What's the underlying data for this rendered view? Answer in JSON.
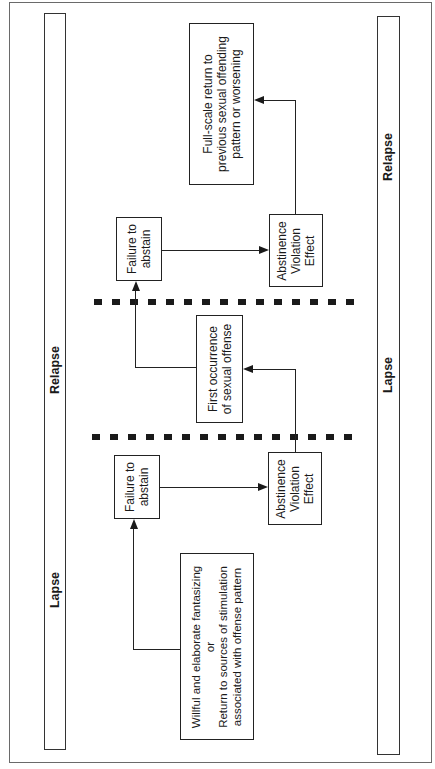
{
  "diagram": {
    "left_band": {
      "labels": [
        "Relapse",
        "Lapse"
      ]
    },
    "right_band": {
      "labels": [
        "Relapse",
        "Lapse"
      ]
    },
    "nodes": {
      "trigger": {
        "line1": "Willful and elaborate fantasizing",
        "line2": "or",
        "line3": "Return to sources of stimulation",
        "line4": "associated with offense pattern"
      },
      "failure_1": {
        "line1": "Failure to",
        "line2": "abstain"
      },
      "ave_1": {
        "line1": "Abstinence",
        "line2": "Violation",
        "line3": "Effect"
      },
      "first_offense": {
        "line1": "First occurrence",
        "line2": "of sexual offense"
      },
      "failure_2": {
        "line1": "Failure to",
        "line2": "abstain"
      },
      "ave_2": {
        "line1": "Abstinence",
        "line2": "Violation",
        "line3": "Effect"
      },
      "full_scale": {
        "line1": "Full-scale return to",
        "line2": "previous sexual offending",
        "line3": "pattern or worsening"
      }
    },
    "edges": [
      [
        "trigger",
        "failure_1"
      ],
      [
        "failure_1",
        "ave_1"
      ],
      [
        "ave_1",
        "first_offense"
      ],
      [
        "first_offense",
        "failure_2"
      ],
      [
        "failure_2",
        "ave_2"
      ],
      [
        "ave_2",
        "full_scale"
      ]
    ],
    "dividers": 2
  }
}
